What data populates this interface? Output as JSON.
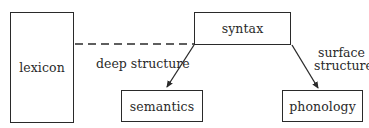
{
  "diagram": {
    "nodes": {
      "lexicon": {
        "label": "lexicon"
      },
      "syntax": {
        "label": "syntax"
      },
      "semantics": {
        "label": "semantics"
      },
      "phonology": {
        "label": "phonology"
      }
    },
    "edges": [
      {
        "from": "lexicon",
        "to": "syntax",
        "style": "dashed",
        "label": ""
      },
      {
        "from": "syntax",
        "to": "semantics",
        "style": "arrow",
        "label": "deep structure"
      },
      {
        "from": "syntax",
        "to": "phonology",
        "style": "arrow",
        "label_line1": "surface",
        "label_line2": "structure"
      }
    ],
    "colors": {
      "stroke": "#2a2a2a",
      "background": "#ffffff"
    }
  }
}
